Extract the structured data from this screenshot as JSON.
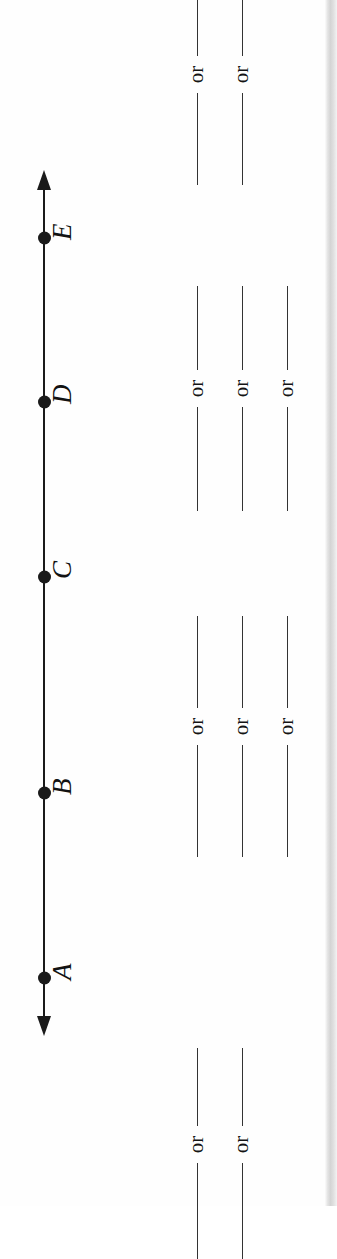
{
  "worksheet": {
    "orientation": "rotated-90-ccw",
    "background_color": "#fefefe",
    "ink_color": "#1a1a1a"
  },
  "number_line": {
    "name": "number-line",
    "arrow_both_ends": true,
    "points": [
      {
        "label": "A",
        "y": 978
      },
      {
        "label": "B",
        "y": 793
      },
      {
        "label": "C",
        "y": 577
      },
      {
        "label": "D",
        "y": 402
      },
      {
        "label": "E",
        "y": 238
      }
    ]
  },
  "answer_blanks": {
    "separator_word": "or",
    "groups": [
      {
        "id": "a-1",
        "x": 196,
        "top": 1048,
        "rule_before": 78,
        "rule_after": 96
      },
      {
        "id": "a-2",
        "x": 241,
        "top": 1048,
        "rule_before": 78,
        "rule_after": 96
      },
      {
        "id": "b-1",
        "x": 196,
        "top": 616,
        "rule_before": 92,
        "rule_after": 112
      },
      {
        "id": "b-2",
        "x": 241,
        "top": 616,
        "rule_before": 92,
        "rule_after": 112
      },
      {
        "id": "b-3",
        "x": 286,
        "top": 616,
        "rule_before": 92,
        "rule_after": 112
      },
      {
        "id": "d-1",
        "x": 196,
        "top": 286,
        "rule_before": 84,
        "rule_after": 104
      },
      {
        "id": "d-2",
        "x": 241,
        "top": 286,
        "rule_before": 84,
        "rule_after": 104
      },
      {
        "id": "d-3",
        "x": 286,
        "top": 286,
        "rule_before": 84,
        "rule_after": 104
      },
      {
        "id": "e-1",
        "x": 196,
        "top": -6,
        "rule_before": 62,
        "rule_after": 92
      },
      {
        "id": "e-2",
        "x": 241,
        "top": -6,
        "rule_before": 62,
        "rule_after": 92
      }
    ]
  }
}
